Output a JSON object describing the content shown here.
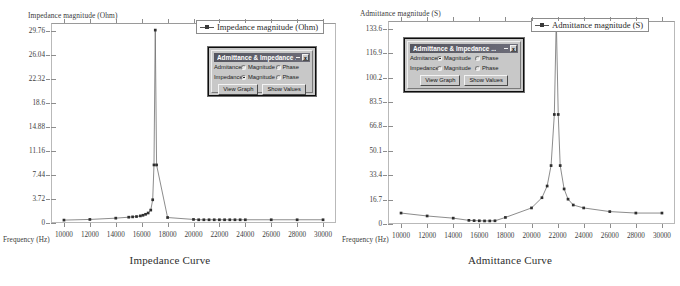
{
  "panels": [
    {
      "id": "impedance",
      "caption": "Impedance Curve",
      "y_axis_title": "Impedance magnitude (Ohm)",
      "x_axis_title": "Frequency (Hz)",
      "legend_label": "Impedance magnitude (Ohm)",
      "dialog": {
        "title": "Admittance & Impedance ...",
        "minimize_label": "_",
        "close_label": "x",
        "rows": [
          {
            "label": "Admitance:",
            "options": [
              {
                "label": "Magnitude",
                "selected": false
              },
              {
                "label": "Phase",
                "selected": false
              }
            ]
          },
          {
            "label": "Impedance:",
            "options": [
              {
                "label": "Magnitude",
                "selected": true
              },
              {
                "label": "Phase",
                "selected": false
              }
            ]
          }
        ],
        "buttons": [
          "View Graph",
          "Show Values"
        ]
      }
    },
    {
      "id": "admittance",
      "caption": "Admittance Curve",
      "y_axis_title": "Admittance magnitude (S)",
      "x_axis_title": "Frequency (Hz)",
      "legend_label": "Admittance magnitude (S)",
      "dialog": {
        "title": "Admittance & Impedance ...",
        "minimize_label": "_",
        "close_label": "x",
        "rows": [
          {
            "label": "Admitance:",
            "options": [
              {
                "label": "Magnitude",
                "selected": true
              },
              {
                "label": "Phase",
                "selected": false
              }
            ]
          },
          {
            "label": "Impedance:",
            "options": [
              {
                "label": "Magnitude",
                "selected": false
              },
              {
                "label": "Phase",
                "selected": false
              }
            ]
          }
        ],
        "buttons": [
          "View Graph",
          "Show Values"
        ]
      }
    }
  ],
  "chart_data": [
    {
      "type": "line",
      "title": "Impedance Curve",
      "xlabel": "Frequency (Hz)",
      "ylabel": "Impedance magnitude (Ohm)",
      "legend": [
        "Impedance magnitude (Ohm)"
      ],
      "legend_position": "top-right",
      "grid": false,
      "xlim": [
        9000,
        31000
      ],
      "ylim": [
        0,
        31.0
      ],
      "xticks": [
        10000,
        12000,
        14000,
        16000,
        18000,
        20000,
        22000,
        24000,
        26000,
        28000,
        30000
      ],
      "yticks": [
        0,
        3.72,
        7.44,
        11.16,
        14.88,
        18.6,
        22.32,
        26.04,
        29.76
      ],
      "x": [
        10000,
        12000,
        14000,
        15000,
        15300,
        15600,
        15900,
        16100,
        16300,
        16500,
        16700,
        16850,
        16950,
        17050,
        17150,
        18000,
        20000,
        20400,
        20800,
        21200,
        21600,
        22000,
        22400,
        22800,
        23200,
        23600,
        24000,
        26000,
        28000,
        30000
      ],
      "y": [
        0.45,
        0.55,
        0.75,
        0.9,
        0.95,
        1.0,
        1.1,
        1.2,
        1.35,
        1.55,
        2.0,
        3.6,
        9.0,
        29.9,
        9.0,
        0.85,
        0.55,
        0.5,
        0.5,
        0.5,
        0.5,
        0.5,
        0.5,
        0.5,
        0.5,
        0.5,
        0.5,
        0.5,
        0.5,
        0.5
      ]
    },
    {
      "type": "line",
      "title": "Admittance Curve",
      "xlabel": "Frequency (Hz)",
      "ylabel": "Admittance magnitude (S)",
      "legend": [
        "Admittance magnitude (S)"
      ],
      "legend_position": "top-right",
      "grid": false,
      "xlim": [
        9000,
        31000
      ],
      "ylim": [
        0,
        139.0
      ],
      "xticks": [
        10000,
        12000,
        14000,
        16000,
        18000,
        20000,
        22000,
        24000,
        26000,
        28000,
        30000
      ],
      "yticks": [
        0,
        16.7,
        33.4,
        50.1,
        66.8,
        83.5,
        100.2,
        116.9,
        133.6
      ],
      "x": [
        10000,
        12000,
        14000,
        15200,
        15600,
        16000,
        16400,
        16800,
        17200,
        18000,
        20000,
        20800,
        21200,
        21500,
        21750,
        21900,
        22050,
        22200,
        22500,
        22800,
        23200,
        24000,
        26000,
        28000,
        30000
      ],
      "y": [
        7.5,
        5.5,
        4.0,
        2.5,
        2.3,
        2.2,
        2.1,
        2.1,
        2.2,
        4.5,
        11.0,
        18.0,
        26.0,
        40.0,
        75.0,
        140.0,
        75.0,
        40.0,
        24.0,
        17.0,
        13.0,
        11.0,
        8.5,
        7.5,
        7.5
      ]
    }
  ]
}
